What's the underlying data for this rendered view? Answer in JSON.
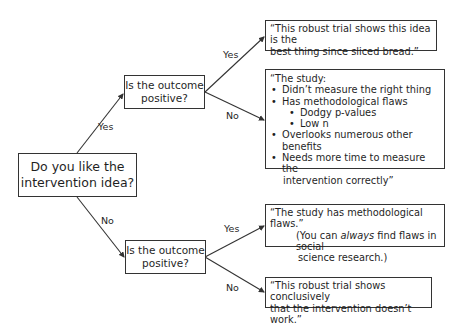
{
  "root": {
    "label_line1": "Do you like the",
    "label_line2": "intervention idea?"
  },
  "edges": {
    "root_yes": "Yes",
    "root_no": "No",
    "q1_yes": "Yes",
    "q1_no": "No",
    "q2_yes": "Yes",
    "q2_no": "No"
  },
  "q1": {
    "line1": "Is the outcome",
    "line2": "positive?"
  },
  "q2": {
    "line1": "Is the outcome",
    "line2": "positive?"
  },
  "outcomes": {
    "yes_yes": {
      "line1": "“This robust trial shows this idea is the",
      "line2": "best thing since sliced bread.”"
    },
    "yes_no": {
      "intro": "“The study:",
      "items": [
        "Didn’t measure the right thing",
        "Has methodological flaws",
        "Dodgy p-values",
        "Low n",
        "Overlooks numerous other benefits",
        "Needs more time to measure the"
      ],
      "continuation": "intervention correctly”"
    },
    "no_yes": {
      "line1": "“The study has methodological flaws.”",
      "line2_pre": "(You can ",
      "line2_em": "always",
      "line2_post": " find flaws in social",
      "line3": "science research.)"
    },
    "no_no": {
      "line1": "“This robust trial shows conclusively",
      "line2": "that the intervention doesn’t work.”"
    }
  },
  "colors": {
    "line": "#333333",
    "text": "#1f1f1f",
    "background": "#ffffff"
  }
}
